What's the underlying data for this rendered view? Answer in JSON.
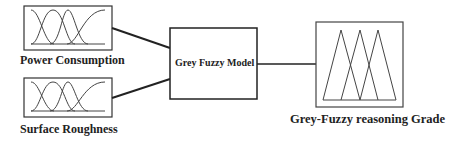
{
  "diagram": {
    "inputs": [
      {
        "label": "Power Consumption",
        "shape": "gaussian-membership-functions"
      },
      {
        "label": "Surface Roughness",
        "shape": "gaussian-membership-functions"
      }
    ],
    "model": {
      "label": "Grey Fuzzy Model"
    },
    "output": {
      "label": "Grey-Fuzzy reasoning Grade",
      "shape": "triangular-membership-functions"
    },
    "colors": {
      "stroke": "#222222",
      "background": "#ffffff"
    }
  }
}
